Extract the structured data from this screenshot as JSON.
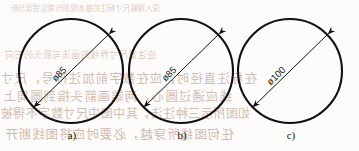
{
  "figure": {
    "kind": "engineering-drawing",
    "line_color": "#111111",
    "text_color": "#1a1a1a",
    "bleed_color": "#b08b78",
    "items": [
      {
        "caption": "a)",
        "dimension_label": "ø85",
        "diameter_value": 85,
        "arrow_style": "double-arrow-diagonal"
      },
      {
        "caption": "b)",
        "dimension_label": "ø85",
        "diameter_value": 85,
        "arrow_style": "double-arrow-diagonal"
      },
      {
        "caption": "c)",
        "dimension_label": "ø100",
        "diameter_value": 100,
        "arrow_style": "double-arrow-diagonal"
      }
    ]
  },
  "background_bleed_text": [
    "深入理解尺寸标注的基本规则与常见错误分析",
    "应注意尺寸界线的画法与箭头的方向",
    "在标注直径时，应在数字前加注符号，尺寸",
    "线应通过圆心，两端画箭头指到圆周上",
    "如图所示三种注法，其中图中尺寸数字不得被",
    "任何图线所穿越，必要时应将图线断开"
  ]
}
